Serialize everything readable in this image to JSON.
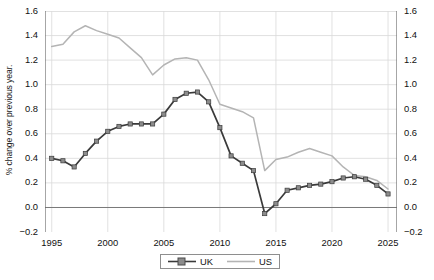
{
  "chart_data": {
    "type": "line",
    "title": "",
    "xlabel": "",
    "ylabel": "% change over previous year.",
    "xlim": [
      1994.4,
      2025.8
    ],
    "ylim": [
      -0.2,
      1.6
    ],
    "grid": true,
    "legend_position": "bottom-center",
    "x_ticks": [
      "1995",
      "2000",
      "2005",
      "2010",
      "2015",
      "2020",
      "2025"
    ],
    "x_tick_values": [
      1995,
      2000,
      2005,
      2010,
      2015,
      2020,
      2025
    ],
    "y_ticks": [
      "-0.2",
      "0.0",
      "0.2",
      "0.4",
      "0.6",
      "0.8",
      "1.0",
      "1.2",
      "1.4",
      "1.6"
    ],
    "y_tick_values": [
      -0.2,
      0.0,
      0.2,
      0.4,
      0.6,
      0.8,
      1.0,
      1.2,
      1.4,
      1.6
    ],
    "y_axis_right": true,
    "zero_line": 0.0,
    "x": [
      1995,
      1996,
      1997,
      1998,
      1999,
      2000,
      2001,
      2002,
      2003,
      2004,
      2005,
      2006,
      2007,
      2008,
      2009,
      2010,
      2011,
      2012,
      2013,
      2014,
      2015,
      2016,
      2017,
      2018,
      2019,
      2020,
      2021,
      2022,
      2023,
      2024,
      2025
    ],
    "series": [
      {
        "name": "UK",
        "color": "#3a3a3a",
        "marker": "square",
        "marker_color": "#8c8c8c",
        "values": [
          0.4,
          0.38,
          0.33,
          0.44,
          0.54,
          0.62,
          0.66,
          0.68,
          0.68,
          0.68,
          0.76,
          0.88,
          0.93,
          0.94,
          0.86,
          0.65,
          0.42,
          0.36,
          0.3,
          -0.05,
          0.03,
          0.14,
          0.16,
          0.18,
          0.19,
          0.21,
          0.24,
          0.25,
          0.23,
          0.18,
          0.11
        ]
      },
      {
        "name": "US",
        "color": "#b4b4b4",
        "marker": "none",
        "values": [
          1.31,
          1.33,
          1.43,
          1.48,
          1.44,
          1.41,
          1.38,
          1.3,
          1.22,
          1.08,
          1.16,
          1.21,
          1.22,
          1.2,
          1.04,
          0.84,
          0.81,
          0.78,
          0.73,
          0.3,
          0.39,
          0.41,
          0.45,
          0.48,
          0.45,
          0.42,
          0.33,
          0.26,
          0.25,
          0.22,
          0.15
        ]
      }
    ]
  },
  "legend": {
    "items": [
      {
        "label": "UK"
      },
      {
        "label": "US"
      }
    ]
  },
  "colors": {
    "uk_line": "#3a3a3a",
    "uk_marker": "#8c8c8c",
    "us_line": "#b4b4b4",
    "grid": "#d9d9d9",
    "axis": "#6b6b6b",
    "background": "#ffffff"
  }
}
